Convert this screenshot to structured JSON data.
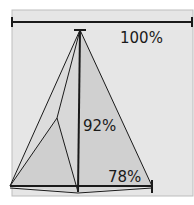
{
  "diagram": {
    "labels": {
      "top": "100%",
      "middle": "92%",
      "bottom": "78%"
    },
    "colors": {
      "background": "#e6e6e6",
      "frame": "#e0e0e0",
      "fill_light": "#d2d2d2",
      "fill_dark": "#c4c4c4",
      "line": "#1a1a1a"
    }
  }
}
